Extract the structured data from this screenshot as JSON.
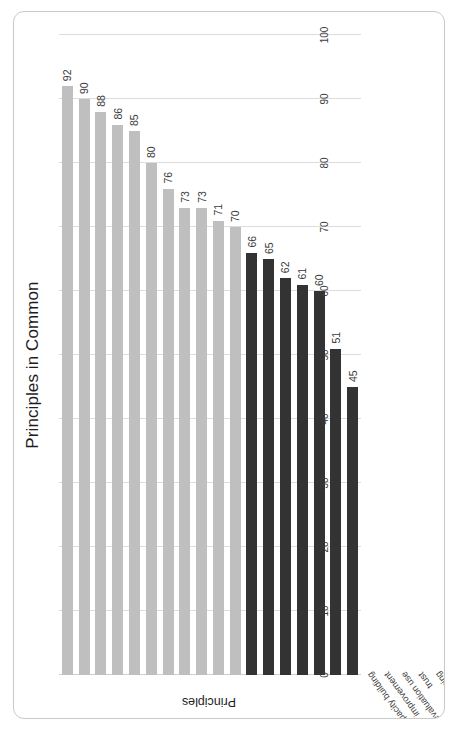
{
  "chart_data": {
    "type": "bar",
    "orientation": "horizontal",
    "title": "Principles in Common",
    "xlabel": "Principles",
    "ylabel": "",
    "ylim": [
      0,
      100
    ],
    "grid": true,
    "legend": "none",
    "axis_ticks": [
      "0",
      "10",
      "20",
      "30",
      "40",
      "50",
      "60",
      "70",
      "80",
      "90",
      "100"
    ],
    "categories": [
      "capacity building",
      "improvement",
      "evaluation use",
      "trust",
      "organizational learning",
      "community knowledge",
      "accountability",
      "empathy",
      "inclusion",
      "evidence-based strategies",
      "sustainability",
      "social justice",
      "democratic participation",
      "community ownership",
      "competence",
      "empowerment",
      "social support",
      "self-determination"
    ],
    "values": [
      92,
      90,
      88,
      86,
      85,
      80,
      76,
      73,
      73,
      71,
      70,
      66,
      65,
      62,
      61,
      60,
      51,
      45
    ],
    "value_labels": [
      "92",
      "90",
      "88",
      "86",
      "85",
      "80",
      "76",
      "73",
      "73",
      "71",
      "70",
      "66",
      "65",
      "62",
      "61",
      "60",
      "51",
      "45"
    ],
    "bar_colors": [
      "#bfbfbf",
      "#bfbfbf",
      "#bfbfbf",
      "#bfbfbf",
      "#bfbfbf",
      "#bfbfbf",
      "#bfbfbf",
      "#bfbfbf",
      "#bfbfbf",
      "#bfbfbf",
      "#bfbfbf",
      "#333333",
      "#333333",
      "#333333",
      "#333333",
      "#333333",
      "#333333",
      "#333333"
    ],
    "colors": {
      "light_bar": "#bfbfbf",
      "dark_bar": "#333333",
      "gridline": "#dcdcdc",
      "text": "#1d1d1d",
      "frame": "#c9c9c9"
    }
  }
}
